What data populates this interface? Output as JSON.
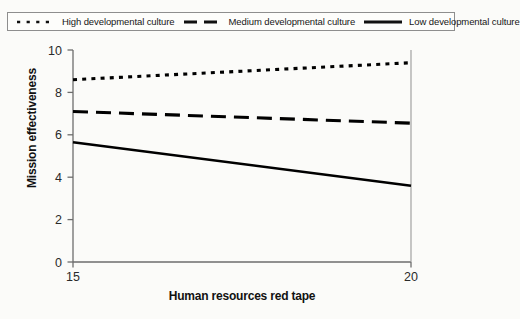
{
  "chart_data": {
    "type": "line",
    "title": "",
    "xlabel": "Human resources red tape",
    "ylabel": "Mission effectiveness",
    "xlim": [
      15,
      20
    ],
    "ylim": [
      0,
      10
    ],
    "xticks": [
      15,
      20
    ],
    "xticklabels": [
      "15",
      "20"
    ],
    "yticks": [
      0,
      2,
      4,
      6,
      8,
      10
    ],
    "yticklabels": [
      "0",
      "2",
      "4",
      "6",
      "8",
      "10"
    ],
    "grid": false,
    "legend_position": "top",
    "x": [
      15,
      20
    ],
    "series": [
      {
        "name": "High developmental culture",
        "values": [
          8.6,
          9.4
        ],
        "style": "dotted",
        "color": "#000000"
      },
      {
        "name": "Medium developmental culture",
        "values": [
          7.1,
          6.55
        ],
        "style": "dashed",
        "color": "#000000"
      },
      {
        "name": "Low developmental culture",
        "values": [
          5.65,
          3.6
        ],
        "style": "solid",
        "color": "#000000"
      }
    ]
  },
  "legend": {
    "items": [
      {
        "label": "High developmental culture",
        "swatch": "dotted-line-swatch"
      },
      {
        "label": "Medium developmental culture",
        "swatch": "dashed-line-swatch"
      },
      {
        "label": "Low developmental culture",
        "swatch": "solid-line-swatch"
      }
    ]
  },
  "axes": {
    "y_title": "Mission effectiveness",
    "x_title": "Human resources red tape",
    "y_tick_0": "0",
    "y_tick_1": "2",
    "y_tick_2": "4",
    "y_tick_3": "6",
    "y_tick_4": "8",
    "y_tick_5": "10",
    "x_tick_0": "15",
    "x_tick_1": "20"
  }
}
